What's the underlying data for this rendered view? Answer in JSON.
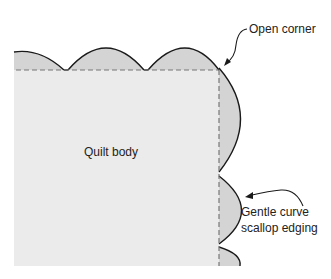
{
  "diagram": {
    "colors": {
      "quilt_body": "#ebebeb",
      "scallop_fill": "#d4d4d4",
      "outline": "#1a1a1a",
      "dashed_line": "#777777",
      "text": "#222222"
    },
    "labels": {
      "quilt_body": "Quilt body",
      "open_corner": "Open corner",
      "scallop_line1": "Gentle curve",
      "scallop_line2": "scallop edging"
    }
  }
}
